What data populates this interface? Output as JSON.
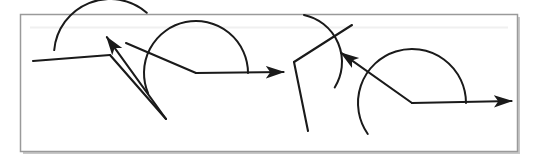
{
  "document": {
    "title": "Angles Diagram",
    "background_color": "#ffffff",
    "width": 535,
    "height": 167
  },
  "frame": {
    "name": "outer-border",
    "x": 20.5,
    "y": 14.5,
    "width": 497,
    "height": 137,
    "stroke": "#9a9a9a",
    "stroke_width": 1.5,
    "fill": "#ffffff",
    "shadow_color": "#c8c8c8"
  },
  "style": {
    "line_color": "#1a1a1a",
    "line_width": 2.1,
    "arc_color": "#1a1a1a",
    "arc_width": 2.0,
    "arrow_color": "#1a1a1a"
  },
  "chart_data": {
    "type": "diagram",
    "figures": [
      {
        "id": "figure-1",
        "label": "Figure 1 - reflex angle opening downward",
        "vertex": [
          110,
          55
        ],
        "rays": [
          {
            "name": "ray-left-horizontal",
            "from": [
              110,
              55
            ],
            "to": [
              33,
              61
            ],
            "arrow": false
          },
          {
            "name": "ray-down-right",
            "from": [
              110,
              55
            ],
            "to": [
              166,
              119
            ],
            "arrow": false
          },
          {
            "name": "ray-up-left-arrow",
            "from": [
              166,
              119
            ],
            "to": [
              106,
              36
            ],
            "arrow": true
          }
        ],
        "arc": {
          "center": [
            110,
            55
          ],
          "radius": 56,
          "start_angle_deg": 175,
          "end_angle_deg": 49,
          "sweep": "clockwise-below"
        }
      },
      {
        "id": "figure-2",
        "label": "Figure 2 - obtuse angle with arc above",
        "vertex": [
          196,
          73
        ],
        "rays": [
          {
            "name": "ray-up-left",
            "from": [
              196,
              73
            ],
            "to": [
              126,
              43
            ],
            "arrow": false
          },
          {
            "name": "ray-right-arrow",
            "from": [
              196,
              73
            ],
            "to": [
              285,
              72
            ],
            "arrow": true
          }
        ],
        "arc": {
          "center": [
            196,
            73
          ],
          "radius": 52,
          "start_angle_deg": 203,
          "end_angle_deg": 0,
          "sweep": "counter-clockwise-above"
        }
      },
      {
        "id": "figure-3",
        "label": "Figure 3 - angle with arc between upper-right and downward rays",
        "vertex": [
          294,
          62
        ],
        "rays": [
          {
            "name": "ray-up-right",
            "from": [
              294,
              62
            ],
            "to": [
              352,
              25
            ],
            "arrow": false
          },
          {
            "name": "ray-down",
            "from": [
              294,
              62
            ],
            "to": [
              308,
              131
            ],
            "arrow": false
          }
        ],
        "arc": {
          "center": [
            294,
            62
          ],
          "radius": 48,
          "start_angle_deg": -32,
          "end_angle_deg": 78,
          "sweep": "clockwise-right"
        }
      },
      {
        "id": "figure-4",
        "label": "Figure 4 - obtuse angle with two arrows",
        "vertex": [
          412,
          103
        ],
        "rays": [
          {
            "name": "ray-up-left-arrow",
            "from": [
              412,
              103
            ],
            "to": [
              340,
              52
            ],
            "arrow": true
          },
          {
            "name": "ray-right-arrow",
            "from": [
              412,
              103
            ],
            "to": [
              513,
              101
            ],
            "arrow": true
          }
        ],
        "arc": {
          "center": [
            412,
            103
          ],
          "radius": 54,
          "start_angle_deg": 215,
          "end_angle_deg": 0,
          "sweep": "counter-clockwise-above"
        }
      }
    ]
  }
}
